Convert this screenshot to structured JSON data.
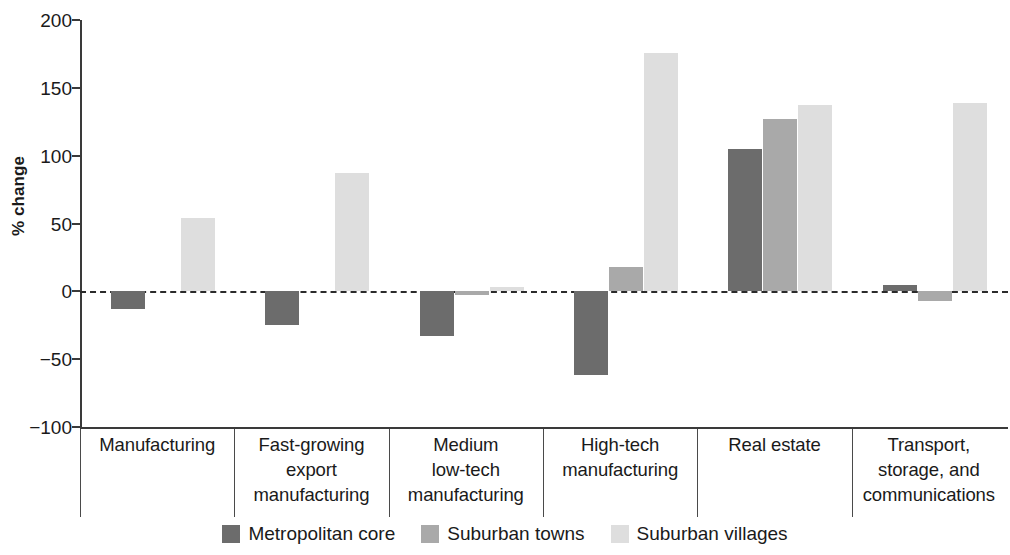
{
  "chart_data": {
    "type": "bar",
    "title": "",
    "xlabel": "",
    "ylabel": "% change",
    "ylim": [
      -100,
      200
    ],
    "yticks": [
      200,
      150,
      100,
      50,
      0,
      -50,
      -100
    ],
    "ytick_labels": [
      "200",
      "150",
      "100",
      "50",
      "0",
      "−100"
    ],
    "grid": false,
    "zero_line": true,
    "legend_position": "bottom-center",
    "categories": [
      "Manufacturing",
      "Fast-growing\nexport\nmanufacturing",
      "Medium\nlow-tech\nmanufacturing",
      "High-tech\nmanufacturing",
      "Real estate",
      "Transport,\nstorage, and\ncommunications"
    ],
    "series": [
      {
        "name": "Metropolitan core",
        "color": "#6c6c6c",
        "values": [
          -13,
          -25,
          -33,
          -62,
          105,
          5
        ]
      },
      {
        "name": "Suburban towns",
        "color": "#a9a9a9",
        "values": [
          0,
          0,
          -3,
          18,
          127,
          -7
        ]
      },
      {
        "name": "Suburban villages",
        "color": "#dedede",
        "values": [
          54,
          87,
          3,
          176,
          137,
          139
        ]
      }
    ]
  },
  "axis": {
    "y_tick_200": "200",
    "y_tick_150": "150",
    "y_tick_100": "100",
    "y_tick_50": "50",
    "y_tick_0": "0",
    "y_tick_neg50": "−50",
    "y_tick_neg100": "−100",
    "y_axis_title": "% change"
  },
  "categories_text": {
    "c0": "Manufacturing",
    "c1": "Fast-growing\nexport\nmanufacturing",
    "c2": "Medium\nlow-tech\nmanufacturing",
    "c3": "High-tech\nmanufacturing",
    "c4": "Real estate",
    "c5": "Transport,\nstorage, and\ncommunications"
  },
  "legend": {
    "items": [
      {
        "label": "Metropolitan core",
        "color": "#6c6c6c"
      },
      {
        "label": "Suburban towns",
        "color": "#a9a9a9"
      },
      {
        "label": "Suburban villages",
        "color": "#dedede"
      }
    ]
  }
}
